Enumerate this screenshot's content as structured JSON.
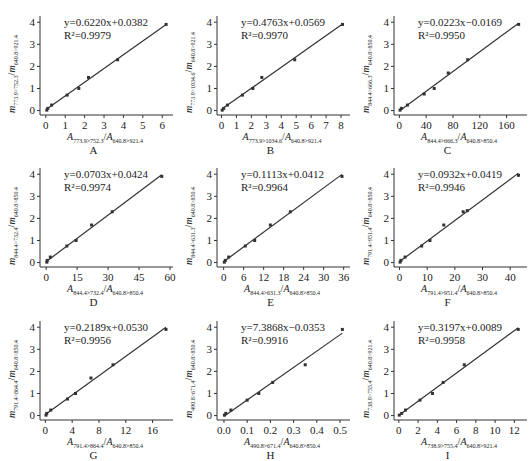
{
  "chart_data": [
    {
      "panel": "A",
      "type": "scatter",
      "equation": "y=0.6220x+0.0382",
      "r2": "R²=0.9979",
      "slope": 0.622,
      "intercept": 0.0382,
      "xlabel": "A773.9>752.3/A640.8>921.4",
      "ylabel": "m773.9>752.3/m640.8>921.4",
      "x_num": "773.9>752.3",
      "x_den": "640.8>921.4",
      "xticks": [
        0,
        1,
        2,
        3,
        4,
        5,
        6
      ],
      "xlim": [
        -0.3,
        6.4
      ],
      "yticks": [
        0,
        1,
        2,
        3,
        4
      ],
      "ylim": [
        -0.2,
        4.1
      ],
      "points": [
        [
          0.05,
          0.02
        ],
        [
          0.1,
          0.1
        ],
        [
          0.3,
          0.25
        ],
        [
          1.1,
          0.7
        ],
        [
          1.7,
          1.0
        ],
        [
          2.2,
          1.5
        ],
        [
          3.7,
          2.3
        ],
        [
          6.2,
          3.9
        ]
      ]
    },
    {
      "panel": "B",
      "type": "scatter",
      "equation": "y=0.4763x+0.0569",
      "r2": "R²=0.9970",
      "slope": 0.4763,
      "intercept": 0.0569,
      "xlabel": "A773.9>1034.6/A640.8>921.4",
      "ylabel": "m773.9>1034.6/m640.8>921.4",
      "x_num": "773.9>1034.6",
      "x_den": "640.8>921.4",
      "xticks": [
        0,
        1,
        2,
        3,
        4,
        5,
        6,
        7,
        8
      ],
      "xlim": [
        -0.3,
        8.4
      ],
      "yticks": [
        0,
        1,
        2,
        3,
        4
      ],
      "ylim": [
        -0.2,
        4.1
      ],
      "points": [
        [
          0.05,
          0.02
        ],
        [
          0.15,
          0.1
        ],
        [
          0.4,
          0.25
        ],
        [
          1.4,
          0.7
        ],
        [
          2.1,
          1.0
        ],
        [
          2.7,
          1.5
        ],
        [
          4.9,
          2.3
        ],
        [
          8.1,
          3.9
        ]
      ]
    },
    {
      "panel": "C",
      "type": "scatter",
      "equation": "y=0.0223x−0.0169",
      "r2": "R²=0.9950",
      "slope": 0.0223,
      "intercept": -0.0169,
      "xlabel": "A844.4>666.3/A640.8>850.4",
      "ylabel": "m844.4>666.3/m640.8>850.4",
      "x_num": "844.4>666.3",
      "x_den": "640.8>850.4",
      "xticks": [
        0,
        40,
        80,
        120,
        160
      ],
      "xlim": [
        -8,
        186
      ],
      "yticks": [
        0,
        1,
        2,
        3,
        4
      ],
      "ylim": [
        -0.2,
        4.1
      ],
      "points": [
        [
          1,
          0.02
        ],
        [
          3,
          0.1
        ],
        [
          12,
          0.25
        ],
        [
          37,
          0.75
        ],
        [
          52,
          1.0
        ],
        [
          73,
          1.7
        ],
        [
          102,
          2.3
        ],
        [
          178,
          3.9
        ]
      ]
    },
    {
      "panel": "D",
      "type": "scatter",
      "equation": "y=0.0703x+0.0424",
      "r2": "R²=0.9974",
      "slope": 0.0703,
      "intercept": 0.0424,
      "xlabel": "A844.4>732.4/A640.8>850.4",
      "ylabel": "m844.4>732.4/m640.8>850.4",
      "x_num": "844.4>732.4",
      "x_den": "640.8>850.4",
      "xticks": [
        0,
        15,
        30,
        45,
        60
      ],
      "xlim": [
        -3,
        60
      ],
      "yticks": [
        0,
        1,
        2,
        3,
        4
      ],
      "ylim": [
        -0.2,
        4.1
      ],
      "points": [
        [
          0.3,
          0.02
        ],
        [
          0.5,
          0.1
        ],
        [
          2,
          0.25
        ],
        [
          10,
          0.75
        ],
        [
          14.5,
          1.0
        ],
        [
          22,
          1.7
        ],
        [
          32,
          2.3
        ],
        [
          56,
          3.9
        ]
      ]
    },
    {
      "panel": "E",
      "type": "scatter",
      "equation": "y=0.1113x+0.0412",
      "r2": "R²=0.9964",
      "slope": 0.1113,
      "intercept": 0.0412,
      "xlabel": "A844.4>631.3/A640.8>850.4",
      "ylabel": "m844.4>631.3/m640.8>850.4",
      "x_num": "844.4>631.3",
      "x_den": "640.8>850.4",
      "xticks": [
        0,
        6,
        12,
        18,
        24,
        30,
        36
      ],
      "xlim": [
        -2,
        37
      ],
      "yticks": [
        0,
        1,
        2,
        3,
        4
      ],
      "ylim": [
        -0.2,
        4.1
      ],
      "points": [
        [
          0.2,
          0.02
        ],
        [
          0.5,
          0.1
        ],
        [
          1.5,
          0.25
        ],
        [
          6.5,
          0.75
        ],
        [
          9.3,
          1.0
        ],
        [
          14,
          1.7
        ],
        [
          20,
          2.3
        ],
        [
          35.5,
          3.9
        ]
      ]
    },
    {
      "panel": "F",
      "type": "scatter",
      "equation": "y=0.0932x+0.0419",
      "r2": "R²=0.9946",
      "slope": 0.0932,
      "intercept": 0.0419,
      "xlabel": "A791.4>951.4/A640.8>850.4",
      "ylabel": "m791.4>951.4/m640.8>850.4",
      "x_num": "791.4>951.4",
      "x_den": "640.8>850.4",
      "xticks": [
        0,
        10,
        20,
        30,
        40
      ],
      "xlim": [
        -2,
        45
      ],
      "yticks": [
        0,
        1,
        2,
        3,
        4
      ],
      "ylim": [
        -0.2,
        4.1
      ],
      "points": [
        [
          0.2,
          0.02
        ],
        [
          0.5,
          0.1
        ],
        [
          2,
          0.25
        ],
        [
          8,
          0.75
        ],
        [
          11,
          1.0
        ],
        [
          16,
          1.7
        ],
        [
          23,
          2.3
        ],
        [
          24.5,
          2.35
        ],
        [
          43,
          3.95
        ]
      ]
    },
    {
      "panel": "G",
      "type": "scatter",
      "equation": "y=0.2189x+0.0530",
      "r2": "R²=0.9956",
      "slope": 0.2189,
      "intercept": 0.053,
      "xlabel": "A791.4>864.4/A640.8>850.4",
      "ylabel": "m791.4>864.4/m640.8>850.4",
      "x_num": "791.4>864.4",
      "x_den": "640.8>850.4",
      "xticks": [
        0,
        4,
        8,
        12,
        16
      ],
      "xlim": [
        -0.8,
        18.6
      ],
      "yticks": [
        0,
        1,
        2,
        3,
        4
      ],
      "ylim": [
        -0.2,
        4.1
      ],
      "points": [
        [
          0.1,
          0.02
        ],
        [
          0.2,
          0.1
        ],
        [
          0.8,
          0.25
        ],
        [
          3.3,
          0.75
        ],
        [
          4.5,
          1.0
        ],
        [
          6.8,
          1.7
        ],
        [
          10.1,
          2.3
        ],
        [
          18,
          3.9
        ]
      ]
    },
    {
      "panel": "H",
      "type": "scatter",
      "equation": "y=7.3868x−0.0353",
      "r2": "R²=0.9916",
      "slope": 7.3868,
      "intercept": -0.0353,
      "xlabel": "A490.8>671.4/A640.8>850.4",
      "ylabel": "m490.8>671.4/m640.8>850.4",
      "x_num": "490.8>671.4",
      "x_den": "640.8>850.4",
      "xticks": [
        0.0,
        0.1,
        0.2,
        0.3,
        0.4,
        0.5
      ],
      "xlim": [
        -0.03,
        0.53
      ],
      "yticks": [
        0,
        1,
        2,
        3,
        4
      ],
      "ylim": [
        -0.2,
        4.1
      ],
      "points": [
        [
          0.002,
          0.02
        ],
        [
          0.008,
          0.1
        ],
        [
          0.03,
          0.25
        ],
        [
          0.1,
          0.7
        ],
        [
          0.15,
          1.0
        ],
        [
          0.21,
          1.5
        ],
        [
          0.35,
          2.3
        ],
        [
          0.51,
          3.9
        ]
      ]
    },
    {
      "panel": "I",
      "type": "scatter",
      "equation": "y=0.3197x+0.0089",
      "r2": "R²=0.9958",
      "slope": 0.3197,
      "intercept": 0.0089,
      "xlabel": "A738.9>755.4/A640.8>921.4",
      "ylabel": "m738.9>755.4/m640.8>921.4",
      "x_num": "738.9>755.4",
      "x_den": "640.8>921.4",
      "xticks": [
        0,
        2,
        4,
        6,
        8,
        10,
        12
      ],
      "xlim": [
        -0.5,
        13
      ],
      "yticks": [
        0,
        1,
        2,
        3,
        4
      ],
      "ylim": [
        -0.2,
        4.1
      ],
      "points": [
        [
          0.05,
          0.02
        ],
        [
          0.3,
          0.1
        ],
        [
          0.7,
          0.25
        ],
        [
          2.2,
          0.7
        ],
        [
          3.5,
          1.0
        ],
        [
          4.6,
          1.5
        ],
        [
          6.8,
          2.3
        ],
        [
          12.4,
          3.9
        ]
      ]
    }
  ],
  "colors": {
    "line": "#333333",
    "axis": "#333333",
    "point": "#333333",
    "text": "#222222"
  }
}
